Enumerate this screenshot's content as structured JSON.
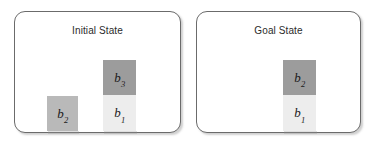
{
  "figure": {
    "type": "blocks-world-diagram",
    "width": 374,
    "height": 143,
    "background_color": "#ffffff"
  },
  "colors": {
    "panel_border": "#6b6b6b",
    "panel_background": "#ffffff",
    "block_dark": "#9c9c9c",
    "block_medium": "#b9b9b9",
    "block_light": "#ededed",
    "label_text": "#1a1a1a",
    "title_text": "#2b2b2b"
  },
  "panels": [
    {
      "id": "initial",
      "title": "Initial State",
      "stacks": [
        {
          "id": "initial-stack-left",
          "blocks": [
            {
              "name": "b2",
              "label_base": "b",
              "label_sub": "2",
              "fill": "medium",
              "level": 0
            }
          ]
        },
        {
          "id": "initial-stack-right",
          "blocks": [
            {
              "name": "b1",
              "label_base": "b",
              "label_sub": "1",
              "fill": "light",
              "level": 0
            },
            {
              "name": "b3",
              "label_base": "b",
              "label_sub": "3",
              "fill": "dark",
              "level": 1
            }
          ]
        }
      ]
    },
    {
      "id": "goal",
      "title": "Goal State",
      "stacks": [
        {
          "id": "goal-stack",
          "blocks": [
            {
              "name": "b1",
              "label_base": "b",
              "label_sub": "1",
              "fill": "light",
              "level": 0
            },
            {
              "name": "b2",
              "label_base": "b",
              "label_sub": "2",
              "fill": "dark",
              "level": 1
            }
          ]
        }
      ]
    }
  ]
}
